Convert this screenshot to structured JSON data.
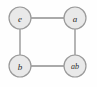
{
  "diagram": {
    "type": "undirected-graph",
    "background_color": "#fefefe",
    "node_fill_color": "#e9e9e9",
    "node_stroke_color": "#9a9a9a",
    "edge_color": "#8e8e8e",
    "label_color": "#2b2b2b",
    "nodes": [
      {
        "id": "e",
        "label": "e",
        "cx": 20,
        "cy": 18,
        "r": 11
      },
      {
        "id": "a",
        "label": "a",
        "cx": 75,
        "cy": 18,
        "r": 11
      },
      {
        "id": "b",
        "label": "b",
        "cx": 20,
        "cy": 66,
        "r": 11
      },
      {
        "id": "ab",
        "label": "ab",
        "cx": 75,
        "cy": 66,
        "r": 11
      }
    ],
    "edges": [
      {
        "from": "e",
        "to": "a",
        "x1": 31,
        "y1": 18,
        "x2": 64,
        "y2": 18
      },
      {
        "from": "e",
        "to": "b",
        "x1": 20,
        "y1": 29,
        "x2": 20,
        "y2": 55
      },
      {
        "from": "a",
        "to": "ab",
        "x1": 75,
        "y1": 29,
        "x2": 75,
        "y2": 55
      },
      {
        "from": "b",
        "to": "ab",
        "x1": 31,
        "y1": 66,
        "x2": 64,
        "y2": 66
      }
    ]
  }
}
